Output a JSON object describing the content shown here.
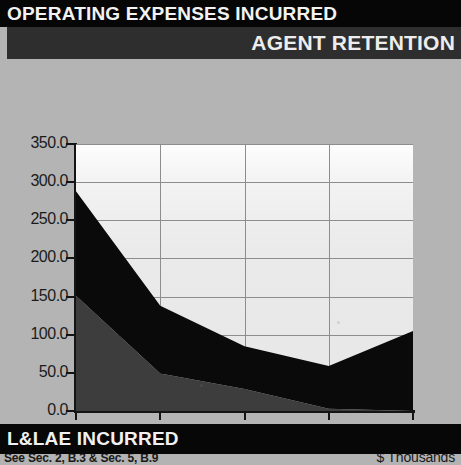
{
  "header": {
    "title": "OPERATING EXPENSES INCURRED",
    "subtitle": "AGENT RETENTION"
  },
  "footer": {
    "title": "L&LAE INCURRED"
  },
  "chart_notes": {
    "source_note": "See Sec. 2, B.3 & Sec. 5, B.9",
    "units": "$ Thousands"
  },
  "colors": {
    "header_bar": "#060606",
    "subheader_bar": "#2e2e2e",
    "footer_bar": "#070707",
    "page_background": "#b4b4b4",
    "plot_background": "#eeeeee",
    "series_operating_expenses": "#3d3d3d",
    "series_llae": "#0a0a0a",
    "axis": "#141414",
    "gridline": "#8d8d8d"
  },
  "chart_data": {
    "type": "area",
    "stacked": true,
    "title": "",
    "subtitle": "",
    "xlabel": "",
    "ylabel": "",
    "units": "$ Thousands",
    "x": [
      2003,
      2004,
      2005,
      2006,
      2007
    ],
    "categories": [
      "2003",
      "2004",
      "2005",
      "2006",
      "2007"
    ],
    "xtick_labels": [
      "2003",
      "",
      "2005",
      "",
      "2007"
    ],
    "ytick_labels": [
      "0.0",
      "50.0",
      "100.0",
      "150.0",
      "200.0",
      "250.0",
      "300.0",
      "350.0"
    ],
    "ytick_values": [
      0,
      50,
      100,
      150,
      200,
      250,
      300,
      350
    ],
    "ylim": [
      0,
      350
    ],
    "xlim": [
      2003,
      2007
    ],
    "grid": true,
    "legend": "none",
    "series": [
      {
        "name": "OPERATING EXPENSES INCURRED",
        "color": "#3d3d3d",
        "values": [
          151,
          49,
          29,
          3,
          0
        ]
      },
      {
        "name": "L&LAE INCURRED",
        "color": "#0a0a0a",
        "values": [
          137,
          89,
          56,
          56,
          105
        ]
      }
    ],
    "totals": [
      288,
      138,
      85,
      59,
      105
    ]
  }
}
